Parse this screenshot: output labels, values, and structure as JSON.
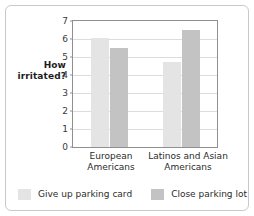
{
  "chart_data": {
    "type": "bar",
    "title": "",
    "xlabel": "",
    "ylabel": "How\nirritated?",
    "ylim": [
      0,
      7
    ],
    "yticks": [
      "0",
      "1",
      "2",
      "3",
      "4",
      "5",
      "6",
      "7"
    ],
    "grid": true,
    "legend_position": "bottom",
    "categories": [
      "European\nAmericans",
      "Latinos and Asian\nAmericans"
    ],
    "series": [
      {
        "name": "Give up parking card",
        "color": "#e4e4e4",
        "values": [
          6.05,
          4.75
        ]
      },
      {
        "name": "Close parking lot",
        "color": "#c3c3c3",
        "values": [
          5.5,
          6.5
        ]
      }
    ]
  },
  "figure": {
    "border_color": "#c9c9c9",
    "background": "#ffffff",
    "axis_color": "#8f8f8f",
    "gridline_color": "#dcdcdc"
  }
}
